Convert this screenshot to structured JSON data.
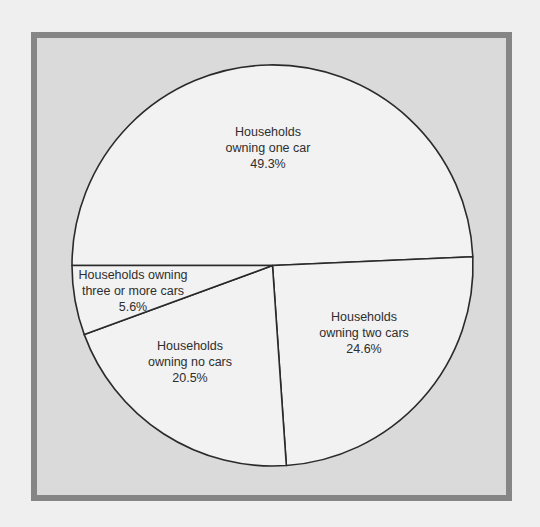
{
  "chart_data": {
    "type": "pie",
    "title": "",
    "start_angle_deg": 180,
    "direction": "clockwise",
    "slices": [
      {
        "name": "Households owning one car",
        "label_lines": [
          "Households",
          "owning one car",
          "49.3%"
        ],
        "value": 49.3
      },
      {
        "name": "Households owning two cars",
        "label_lines": [
          "Households",
          "owning two cars",
          "24.6%"
        ],
        "value": 24.6
      },
      {
        "name": "Households owning no cars",
        "label_lines": [
          "Households",
          "owning no cars",
          "20.5%"
        ],
        "value": 20.5
      },
      {
        "name": "Households owning three or more cars",
        "label_lines": [
          "Households owning",
          "three or more cars",
          "5.6%"
        ],
        "value": 5.6
      }
    ],
    "legend": "none (labels inside slices)",
    "colors": {
      "page_background": "#efefef",
      "frame_border": "#858585",
      "frame_fill": "#dadada",
      "pie_fill": "#f2f2f2",
      "pie_stroke": "#2a2a2a",
      "text": "#2e2e2e"
    }
  },
  "labels": {
    "one_car": {
      "line1": "Households",
      "line2": "owning one car",
      "line3": "49.3%"
    },
    "two_cars": {
      "line1": "Households",
      "line2": "owning two cars",
      "line3": "24.6%"
    },
    "no_cars": {
      "line1": "Households",
      "line2": "owning no cars",
      "line3": "20.5%"
    },
    "three_plus": {
      "line1": "Households owning",
      "line2": "three or more cars",
      "line3": "5.6%"
    }
  }
}
